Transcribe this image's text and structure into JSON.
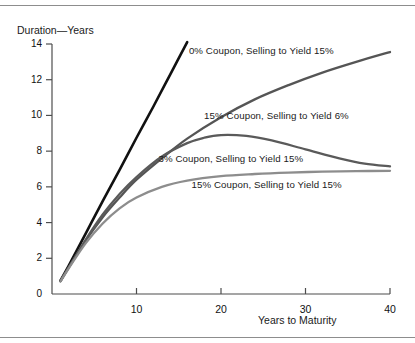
{
  "figure": {
    "has_top_rule": true,
    "has_bottom_rule": true,
    "background": "#ffffff"
  },
  "chart_data": {
    "type": "line",
    "title": "",
    "xlabel": "Years to Maturity",
    "ylabel": "Duration—Years",
    "xlim": [
      0,
      40
    ],
    "ylim": [
      0,
      14
    ],
    "xticks": [
      10,
      20,
      30,
      40
    ],
    "xtick_labels": [
      "10",
      "20",
      "30",
      "40"
    ],
    "yticks": [
      0,
      2,
      4,
      6,
      8,
      10,
      12,
      14
    ],
    "ytick_labels": [
      "0",
      "2",
      "4",
      "6",
      "8",
      "10",
      "12",
      "14"
    ],
    "grid": false,
    "legend_position": "inline-annotations",
    "series": [
      {
        "name": "0% Coupon, Selling to Yield 15%",
        "label": "0% Coupon, Selling to Yield 15%",
        "color": "#111111",
        "width": 2.6,
        "label_x": 16.2,
        "label_y": 13.6,
        "x": [
          1,
          2,
          4,
          6,
          8,
          10,
          12,
          14,
          16
        ],
        "y": [
          0.75,
          1.6,
          3.4,
          5.2,
          6.95,
          8.75,
          10.5,
          12.3,
          14.1
        ]
      },
      {
        "name": "15% Coupon, Selling to Yield 6%",
        "label": "15% Coupon, Selling to Yield 6%",
        "color": "#555555",
        "width": 2.3,
        "label_x": 18.0,
        "label_y": 9.95,
        "x": [
          1,
          2,
          4,
          6,
          8,
          10,
          13,
          16,
          20,
          24,
          28,
          32,
          36,
          40
        ],
        "y": [
          0.72,
          1.5,
          3.0,
          4.3,
          5.4,
          6.4,
          7.6,
          8.7,
          9.9,
          10.9,
          11.7,
          12.4,
          13.0,
          13.55
        ]
      },
      {
        "name": "3% Coupon, Selling to Yield 15%",
        "label": "3% Coupon, Selling to Yield 15%",
        "color": "#5a5a5a",
        "width": 2.3,
        "label_x": 12.6,
        "label_y": 7.55,
        "x": [
          1,
          2,
          4,
          6,
          8,
          10,
          13,
          16,
          18,
          20,
          23,
          26,
          30,
          34,
          37,
          40
        ],
        "y": [
          0.72,
          1.5,
          3.05,
          4.45,
          5.6,
          6.55,
          7.7,
          8.45,
          8.75,
          8.9,
          8.85,
          8.6,
          8.1,
          7.6,
          7.3,
          7.15
        ]
      },
      {
        "name": "15% Coupon, Selling to Yield 15%",
        "label": "15% Coupon, Selling to Yield 15%",
        "color": "#8d8d8d",
        "width": 2.3,
        "label_x": 16.5,
        "label_y": 6.1,
        "x": [
          1,
          2,
          4,
          6,
          8,
          10,
          13,
          16,
          20,
          24,
          28,
          32,
          36,
          40
        ],
        "y": [
          0.7,
          1.45,
          2.85,
          3.95,
          4.8,
          5.4,
          6.0,
          6.35,
          6.6,
          6.72,
          6.8,
          6.85,
          6.88,
          6.9
        ]
      }
    ]
  }
}
